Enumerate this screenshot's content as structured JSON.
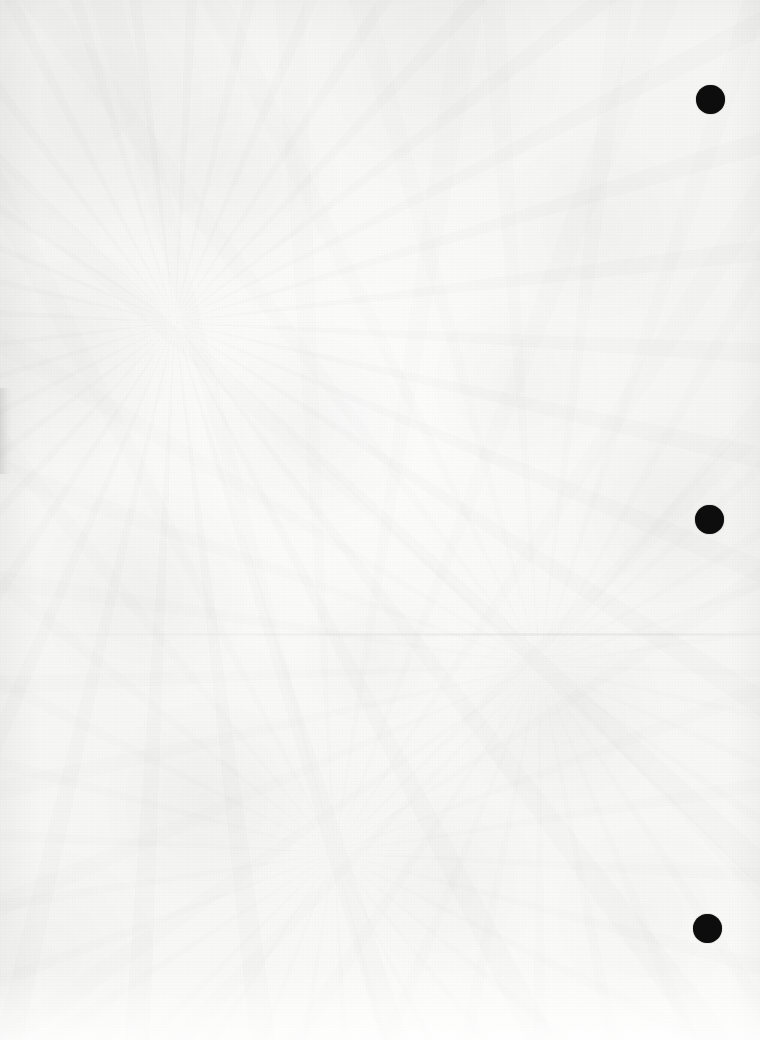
{
  "document": {
    "kind": "scanned-page",
    "title": "Scanned blank page",
    "content_text": "",
    "page_width": 760,
    "page_height": 1040,
    "paper_color": "#f6f6f4",
    "ink_color": "#0d0d0d",
    "orientation": "portrait",
    "visible_text_blocks": []
  },
  "punch_holes": {
    "label": "binder punch holes",
    "count": 3,
    "color": "#0d0d0d",
    "items": [
      {
        "name": "punch-hole-top",
        "cx": 710,
        "cy": 99,
        "diameter": 29
      },
      {
        "name": "punch-hole-middle",
        "cx": 709,
        "cy": 519,
        "diameter": 29
      },
      {
        "name": "punch-hole-bottom",
        "cx": 707,
        "cy": 928,
        "diameter": 29
      }
    ]
  },
  "artifacts": {
    "crease": {
      "name": "horizontal-crease",
      "y": 633,
      "description": "faint horizontal fold line"
    },
    "edge_curl": {
      "name": "left-edge-curl-shadow",
      "x": 0,
      "y": 388,
      "width": 13,
      "height": 86,
      "description": "faint page curl shadow at left margin"
    }
  }
}
